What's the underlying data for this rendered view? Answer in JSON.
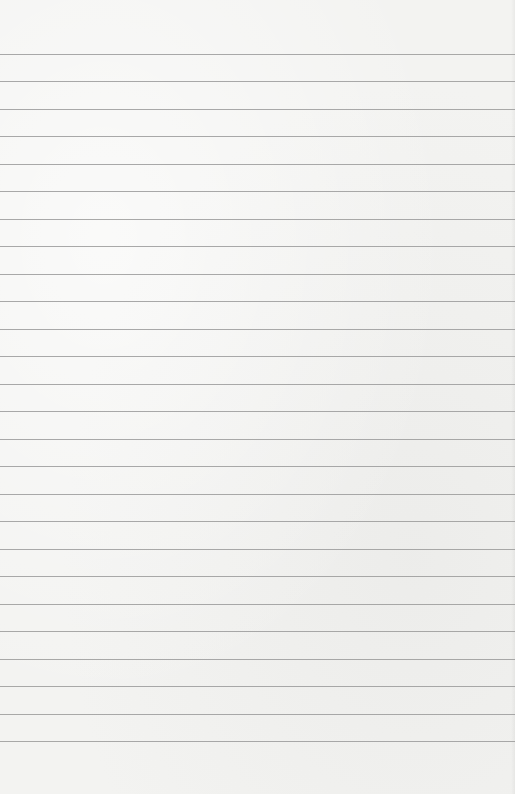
{
  "paper": {
    "type": "lined-paper",
    "background_color": "#f3f3f1",
    "rule_color": "#9a9a9a",
    "first_rule_y": 54,
    "rule_spacing": 27.48,
    "rule_count": 26
  }
}
